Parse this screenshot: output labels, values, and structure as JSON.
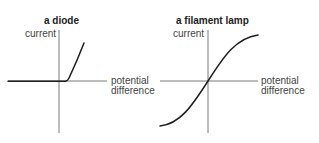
{
  "diagrams": [
    {
      "title": "a diode",
      "y_axis_label": "current",
      "x_axis_label_line1": "potential",
      "x_axis_label_line2": "difference",
      "curve_description": "zero current for negative p.d. and small positive p.d., then current rises steeply"
    },
    {
      "title": "a filament lamp",
      "y_axis_label": "current",
      "x_axis_label_line1": "potential",
      "x_axis_label_line2": "difference",
      "curve_description": "S-shaped curve through origin, gradient decreasing at higher magnitudes of p.d."
    }
  ],
  "colors": {
    "axis": "#6a6a6a",
    "curve": "#1e1e1e",
    "text": "#444444"
  }
}
